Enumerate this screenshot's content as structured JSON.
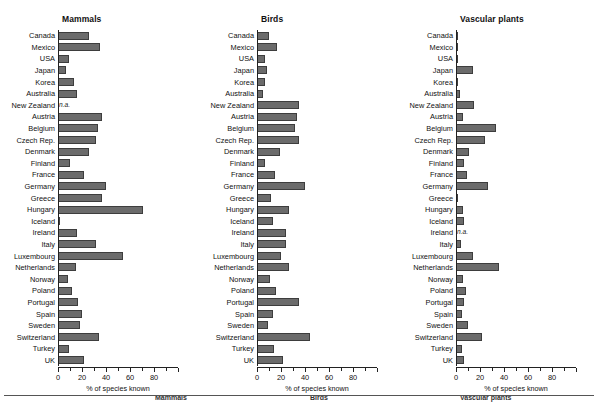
{
  "figure": {
    "axis_title": "% of species known",
    "xticks": [
      0,
      20,
      40,
      60,
      80
    ],
    "xtick_labels": [
      "0",
      "20",
      "40",
      "60",
      "80"
    ],
    "na_label": "n.a.",
    "bar_color": "#6b6b6b",
    "bar_edge_color": "#3d3d3d",
    "text_color": "#111111"
  },
  "footer": {
    "words": [
      "Mammals",
      "Birds",
      "Vascular plants"
    ]
  },
  "chart_data": {
    "type": "bar",
    "xlabel": "% of species known",
    "ylabel": "",
    "xlim": [
      0,
      100
    ],
    "grid": false,
    "legend": "none",
    "orientation": "horizontal",
    "categories": [
      "Canada",
      "Mexico",
      "USA",
      "Japan",
      "Korea",
      "Australia",
      "New Zealand",
      "Austria",
      "Belgium",
      "Czech Rep.",
      "Denmark",
      "Finland",
      "France",
      "Germany",
      "Greece",
      "Hungary",
      "Iceland",
      "Ireland",
      "Italy",
      "Luxembourg",
      "Netherlands",
      "Norway",
      "Poland",
      "Portugal",
      "Spain",
      "Sweden",
      "Switzerland",
      "Turkey",
      "UK"
    ],
    "panels": [
      {
        "title": "Mammals",
        "values": [
          26,
          35,
          9,
          7,
          13,
          16,
          null,
          37,
          33,
          32,
          26,
          10,
          22,
          40,
          37,
          71,
          0.5,
          16,
          32,
          54,
          15,
          8,
          12,
          17,
          20,
          18,
          34,
          9,
          22
        ]
      },
      {
        "title": "Birds",
        "values": [
          10,
          17,
          7,
          8,
          7,
          5,
          35,
          33,
          32,
          35,
          19,
          7,
          15,
          40,
          12,
          27,
          13,
          24,
          24,
          20,
          27,
          11,
          16,
          35,
          13,
          9,
          44,
          14,
          22
        ]
      },
      {
        "title": "Vascular plants",
        "values": [
          2,
          2,
          0.5,
          14,
          0.8,
          3,
          15,
          6,
          33,
          24,
          11,
          7,
          9,
          27,
          1.5,
          6,
          7,
          null,
          4,
          14,
          36,
          6,
          8,
          7,
          5,
          10,
          22,
          5,
          7
        ]
      }
    ]
  }
}
